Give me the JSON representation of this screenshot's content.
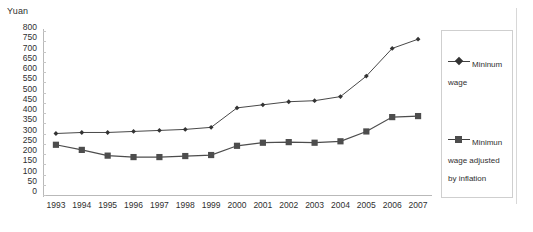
{
  "axis": {
    "y_unit_label": "Yuan",
    "y_ticks": [
      800,
      750,
      700,
      650,
      600,
      550,
      500,
      450,
      400,
      350,
      300,
      250,
      200,
      150,
      100,
      50,
      0
    ],
    "x_ticks": [
      "1993",
      "1994",
      "1995",
      "1996",
      "1997",
      "1998",
      "1999",
      "2000",
      "2001",
      "2002",
      "2003",
      "2004",
      "2005",
      "2006",
      "2007"
    ]
  },
  "legend": {
    "position": "right",
    "entries": [
      {
        "label": "Mininum wage",
        "marker": "diamond",
        "color": "#333333"
      },
      {
        "label": "Minimun wage adjusted by inflation",
        "marker": "square",
        "color": "#4d4d4d"
      }
    ]
  },
  "chart_data": {
    "type": "line",
    "title": "",
    "xlabel": "",
    "ylabel": "Yuan",
    "ylim": [
      0,
      800
    ],
    "ytick_step": 50,
    "grid": false,
    "legend_position": "right",
    "categories": [
      "1993",
      "1994",
      "1995",
      "1996",
      "1997",
      "1998",
      "1999",
      "2000",
      "2001",
      "2002",
      "2003",
      "2004",
      "2005",
      "2006",
      "2007"
    ],
    "series": [
      {
        "name": "Mininum wage",
        "marker": "diamond",
        "color": "#333333",
        "values": [
          300,
          305,
          305,
          310,
          315,
          320,
          330,
          425,
          440,
          455,
          460,
          480,
          580,
          715,
          760
        ]
      },
      {
        "name": "Minimun wage adjusted by inflation",
        "marker": "square",
        "color": "#4d4d4d",
        "values": [
          245,
          220,
          192,
          185,
          185,
          190,
          195,
          240,
          255,
          258,
          255,
          262,
          310,
          380,
          385
        ]
      }
    ]
  }
}
